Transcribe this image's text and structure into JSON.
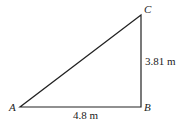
{
  "diagram": {
    "type": "right-triangle",
    "vertices": {
      "A": {
        "label": "A",
        "x": 20,
        "y": 107
      },
      "B": {
        "label": "B",
        "x": 141,
        "y": 107
      },
      "C": {
        "label": "C",
        "x": 141,
        "y": 15
      }
    },
    "sides": {
      "AB": {
        "label": "4.8 m"
      },
      "BC": {
        "label": "3.81 m"
      }
    },
    "stroke_color": "#222222"
  }
}
